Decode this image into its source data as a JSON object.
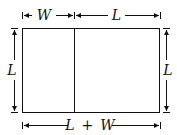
{
  "diagram": {
    "labels": {
      "top_left": "W",
      "top_right": "L",
      "left": "L",
      "right": "L",
      "bottom_var1": "L",
      "bottom_op": "+",
      "bottom_var2": "W"
    },
    "colors": {
      "stroke": "#111111",
      "background": "#ffffff"
    }
  }
}
